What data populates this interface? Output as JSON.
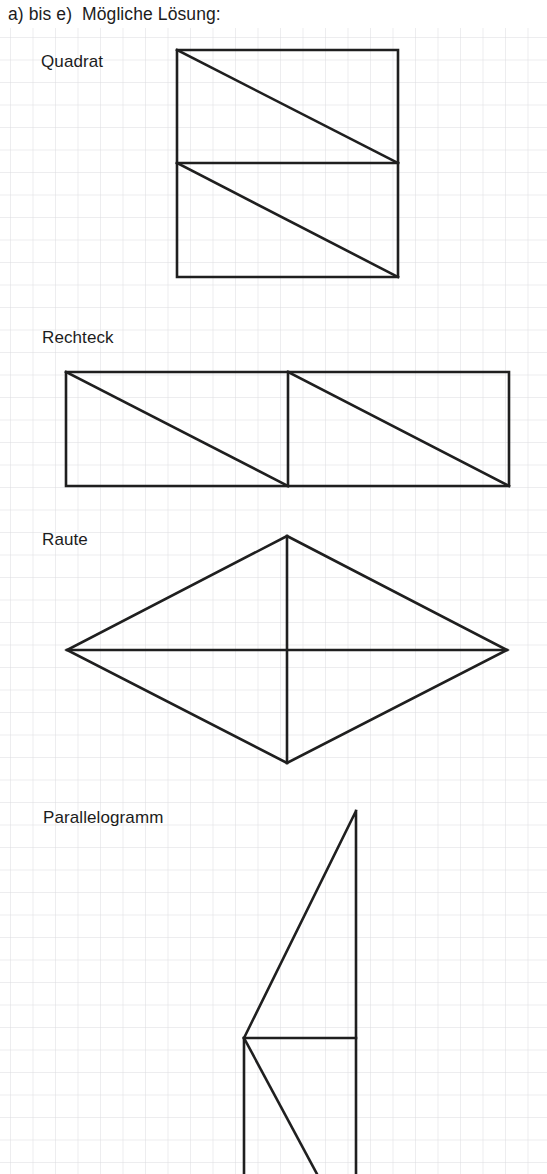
{
  "page": {
    "width": 547,
    "height": 1174,
    "background": "#ffffff",
    "heading": "a) bis e)  Mögliche Lösung:"
  },
  "grid": {
    "description": "light squared graph paper",
    "cell_size": 22.5,
    "origin_x": 10,
    "origin_y": 9,
    "line_color": "#dcdce0",
    "line_width": 1
  },
  "style": {
    "shape_stroke_color": "#1f1f1f",
    "shape_stroke_width": 2.6,
    "text_color": "#1c1c1c"
  },
  "figures": [
    {
      "id": "quadrat",
      "label": "Quadrat",
      "label_x": 41,
      "label_y": 52,
      "outline": "M177,50 L398,50 L398,277 L177,277 Z",
      "cuts": [
        "M177,163 L398,163",
        "M177,50 L398,163",
        "M177,163 L398,277"
      ]
    },
    {
      "id": "rechteck",
      "label": "Rechteck",
      "label_x": 42,
      "label_y": 328,
      "outline": "M66,372 L509,372 L509,486 L66,486 Z",
      "cuts": [
        "M288,372 L288,486",
        "M66,372 L288,486",
        "M288,372 L509,486"
      ]
    },
    {
      "id": "raute",
      "label": "Raute",
      "label_x": 42,
      "label_y": 530,
      "outline": "M287,536 L507,650 L287,763 L67,650 Z",
      "cuts": [
        "M287,536 L287,763",
        "M67,650 L507,650"
      ]
    },
    {
      "id": "parallelogramm",
      "label": "Parallelogramm",
      "label_x": 43,
      "label_y": 808,
      "outline": "M356,811 L356,1174 M356,811 L244,1038 M244,1038 L244,1174",
      "cuts": [
        "M244,1038 L356,1038",
        "M244,1038 L317,1174"
      ],
      "clipped_at_bottom": true
    }
  ]
}
